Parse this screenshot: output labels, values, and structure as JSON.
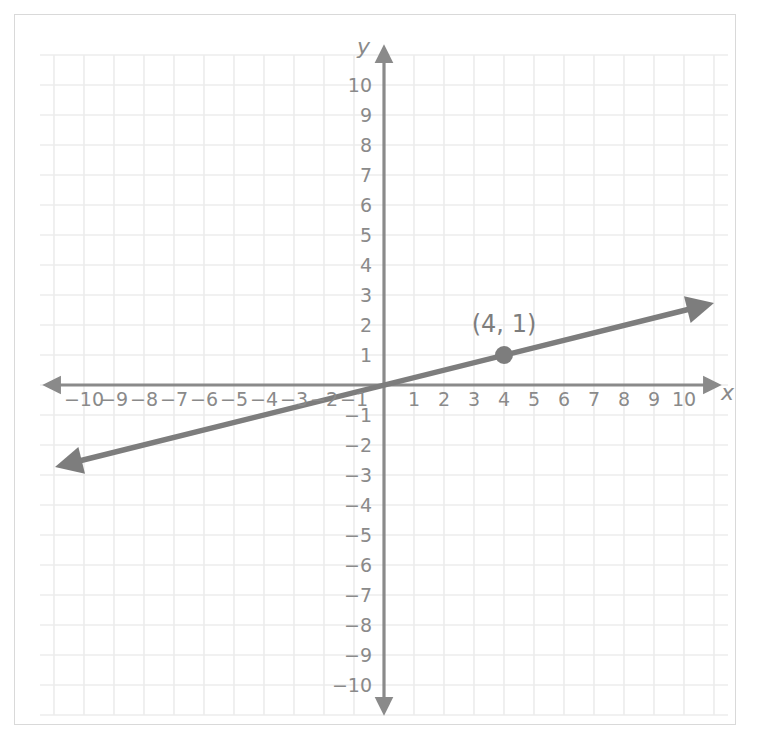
{
  "figure": {
    "background_color": "#ffffff",
    "border_color": "#d9d9d9"
  },
  "chart_data": {
    "type": "line",
    "title": "",
    "subtitle": "",
    "xlabel": "x",
    "ylabel": "y",
    "xlim": [
      -11,
      11
    ],
    "ylim": [
      -11,
      11
    ],
    "grid": true,
    "grid_spacing": 1,
    "legend": false,
    "legend_position": "none",
    "axis_color": "#8a8a8a",
    "grid_color": "#ececec",
    "line_color": "#7d7d7d",
    "point_color": "#7d7d7d",
    "series": [
      {
        "name": "line through origin",
        "type": "line",
        "slope": 0.25,
        "intercept": 0,
        "equation": "y = x/4",
        "x": [
          -10.7,
          10.6
        ],
        "y": [
          -2.675,
          2.65
        ],
        "arrows": "both"
      }
    ],
    "points": [
      {
        "x": 4,
        "y": 1,
        "label": "(4, 1)",
        "marker": "circle",
        "marker_size": 9
      }
    ],
    "x_ticks": [
      -10,
      -9,
      -8,
      -7,
      -6,
      -5,
      -4,
      -3,
      -2,
      -1,
      1,
      2,
      3,
      4,
      5,
      6,
      7,
      8,
      9,
      10
    ],
    "x_tick_labels": [
      "−10",
      "−9",
      "−8",
      "−7",
      "−6",
      "−5",
      "−4",
      "−3",
      "−2",
      "−1",
      "1",
      "2",
      "3",
      "4",
      "5",
      "6",
      "7",
      "8",
      "9",
      "10"
    ],
    "y_ticks": [
      10,
      9,
      8,
      7,
      6,
      5,
      4,
      3,
      2,
      1,
      -1,
      -2,
      -3,
      -4,
      -5,
      -6,
      -7,
      -8,
      -9,
      -10
    ],
    "y_tick_labels": [
      "10",
      "9",
      "8",
      "7",
      "6",
      "5",
      "4",
      "3",
      "2",
      "1",
      "−1",
      "−2",
      "−3",
      "−4",
      "−5",
      "−6",
      "−7",
      "−8",
      "−9",
      "−10"
    ]
  },
  "axes": {
    "x_axis_label": "x",
    "y_axis_label": "y",
    "origin_label": ""
  },
  "annotations": {
    "point_label": "(4, 1)"
  }
}
